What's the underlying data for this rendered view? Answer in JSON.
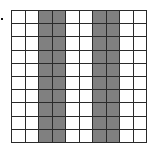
{
  "figure": {
    "type": "grid-model",
    "rows": 10,
    "columns": 10,
    "shaded_columns": [
      3,
      4,
      7,
      8
    ],
    "shaded_cell_count": 40,
    "total_cell_count": 100,
    "colors": {
      "shaded": "#808080",
      "unshaded": "#ffffff",
      "line": "#2a2a2a"
    }
  },
  "bullet": {
    "visible": true
  }
}
